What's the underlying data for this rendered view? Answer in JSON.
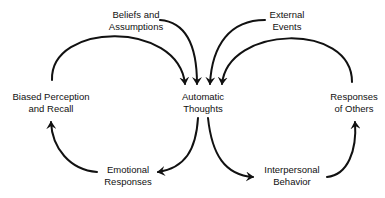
{
  "diagram": {
    "type": "cycle",
    "nodes": {
      "beliefs": {
        "line1": "Beliefs and",
        "line2": "Assumptions"
      },
      "external": {
        "line1": "External",
        "line2": "Events"
      },
      "biased": {
        "line1": "Biased Perception",
        "line2": "and Recall"
      },
      "automatic": {
        "line1": "Automatic",
        "line2": "Thoughts"
      },
      "responses_others": {
        "line1": "Responses",
        "line2": "of Others"
      },
      "emotional": {
        "line1": "Emotional",
        "line2": "Responses"
      },
      "interpersonal": {
        "line1": "Interpersonal",
        "line2": "Behavior"
      }
    },
    "edges": [
      {
        "from": "Beliefs and Assumptions",
        "to": "Automatic Thoughts"
      },
      {
        "from": "External Events",
        "to": "Automatic Thoughts"
      },
      {
        "from": "Biased Perception and Recall",
        "to": "Automatic Thoughts"
      },
      {
        "from": "Responses of Others",
        "to": "Automatic Thoughts"
      },
      {
        "from": "Automatic Thoughts",
        "to": "Emotional Responses"
      },
      {
        "from": "Emotional Responses",
        "to": "Biased Perception and Recall"
      },
      {
        "from": "Automatic Thoughts",
        "to": "Interpersonal Behavior"
      },
      {
        "from": "Interpersonal Behavior",
        "to": "Responses of Others"
      }
    ],
    "colors": {
      "stroke": "#111111",
      "text": "#111111",
      "background": "#ffffff"
    }
  }
}
